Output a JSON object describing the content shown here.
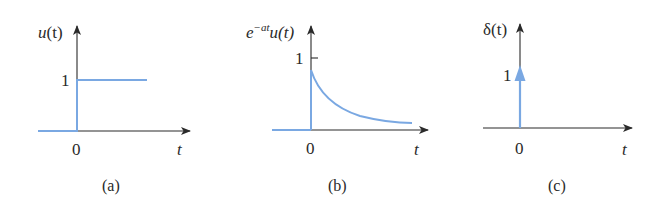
{
  "colors": {
    "signal": "#7aa8e2",
    "axis": "#2a2a2a",
    "background": "#ffffff"
  },
  "panels": [
    {
      "id": "a",
      "caption": "(a)",
      "y_label_main": "u",
      "y_label_arg": "(t)",
      "y_tick": "1",
      "x_origin": "0",
      "x_label": "t",
      "signal": "unit step"
    },
    {
      "id": "b",
      "caption": "(b)",
      "y_label_base": "e",
      "y_label_exp": "−at",
      "y_label_tail": "u(t)",
      "y_tick": "1",
      "x_origin": "0",
      "x_label": "t",
      "signal": "decaying exponential"
    },
    {
      "id": "c",
      "caption": "(c)",
      "y_label_main": "δ(t)",
      "y_tick": "1",
      "x_origin": "0",
      "x_label": "t",
      "signal": "unit impulse"
    }
  ]
}
